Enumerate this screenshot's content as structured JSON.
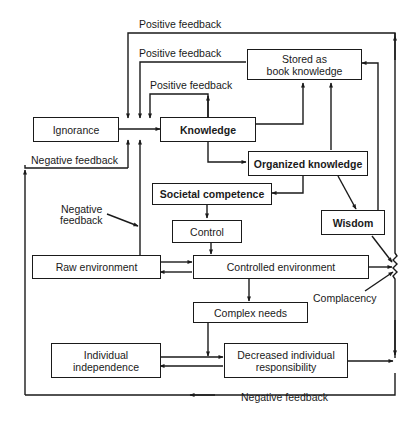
{
  "diagram": {
    "boxes": {
      "ignorance": "Ignorance",
      "knowledge": "Knowledge",
      "stored": "Stored as book knowledge",
      "stored_line1": "Stored as",
      "stored_line2": "book knowledge",
      "organized": "Organized knowledge",
      "societal": "Societal competence",
      "control": "Control",
      "wisdom": "Wisdom",
      "raw_env": "Raw environment",
      "controlled_env": "Controlled environment",
      "complex_needs": "Complex needs",
      "indiv_indep_line1": "Individual",
      "indiv_indep_line2": "independence",
      "decreased_line1": "Decreased individual",
      "decreased_line2": "responsibility"
    },
    "labels": {
      "pos_fb_1": "Positive feedback",
      "pos_fb_2": "Positive feedback",
      "pos_fb_3": "Positive feedback",
      "neg_fb_1": "Negative feedback",
      "neg_fb_2_line1": "Negative",
      "neg_fb_2_line2": "feedback",
      "neg_fb_3": "Negative feedback",
      "complacency": "Complacency"
    }
  }
}
